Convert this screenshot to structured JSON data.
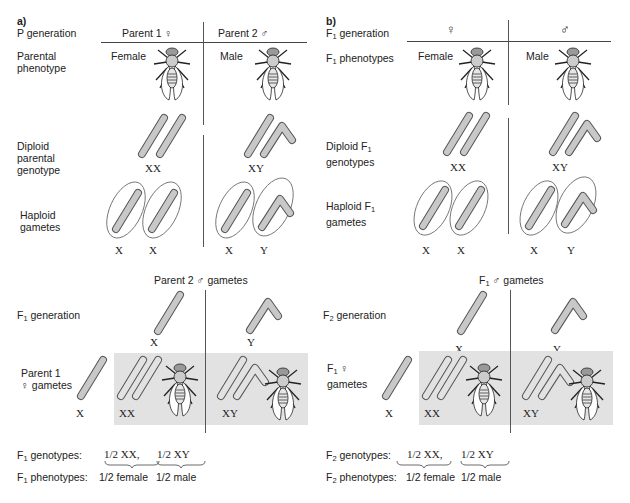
{
  "panels": [
    {
      "tag": "a)",
      "generation_label": "P generation",
      "col_headers": [
        "Parent 1 ♀",
        "Parent 2 ♂"
      ],
      "rows": {
        "phenotype_label_1": "Parental",
        "phenotype_label_2": "phenotype",
        "genotype_label_1": "Diploid",
        "genotype_label_2": "parental",
        "genotype_label_3": "genotype",
        "gametes_label_1": "Haploid",
        "gametes_label_2": "gametes"
      },
      "sexes": [
        "Female",
        "Male"
      ],
      "diploid_genotypes": [
        "XX",
        "XY"
      ],
      "gamete_labels": [
        "X",
        "X",
        "X",
        "Y"
      ],
      "cross_header": "Parent 2 ♂ gametes",
      "next_gen_label": "F1 generation",
      "next_gen_prefix": "F",
      "next_gen_sub": "1",
      "next_gen_suffix": " generation",
      "side_label_1": "Parent 1",
      "side_label_2": "♀ gametes",
      "col_gametes": [
        "X",
        "Y"
      ],
      "row_gamete": "X",
      "offspring": [
        "XX",
        "XY"
      ],
      "summary": {
        "gen_prefix": "F",
        "gen_sub": "1",
        "genotypes_label": " genotypes:",
        "phenotypes_label": " phenotypes:",
        "genotypes": [
          "XX,",
          "XY"
        ],
        "phenotypes": [
          "female",
          "male"
        ],
        "fraction": "1/2"
      }
    },
    {
      "tag": "b)",
      "generation_prefix": "F",
      "generation_sub": "1",
      "generation_suffix": " generation",
      "col_headers": [
        "♀",
        "♂"
      ],
      "rows": {
        "phenotype_label": " phenotypes",
        "genotype_label_1": "Diploid F",
        "genotype_label_2": "genotypes",
        "gametes_label_1": "Haploid F",
        "gametes_label_2": "gametes"
      },
      "sexes": [
        "Female",
        "Male"
      ],
      "diploid_genotypes": [
        "XX",
        "XY"
      ],
      "gamete_labels": [
        "X",
        "X",
        "X",
        "Y"
      ],
      "cross_header_suffix": " ♂ gametes",
      "next_gen_prefix": "F",
      "next_gen_sub": "2",
      "next_gen_suffix": " generation",
      "side_label_1": " ♀",
      "side_label_2": "gametes",
      "col_gametes": [
        "X",
        "Y"
      ],
      "row_gamete": "X",
      "offspring": [
        "XX",
        "XY"
      ],
      "summary": {
        "gen_prefix": "F",
        "gen_sub": "2",
        "genotypes_label": " genotypes:",
        "phenotypes_label": " phenotypes:",
        "genotypes": [
          "XX,",
          "XY"
        ],
        "phenotypes": [
          "female",
          "male"
        ],
        "fraction": "1/2"
      }
    }
  ],
  "colors": {
    "chromosome_fill": "#c8c8c8",
    "chromosome_stroke": "#555555",
    "punnett_bg": "#e2e2e2",
    "line": "#444444"
  }
}
